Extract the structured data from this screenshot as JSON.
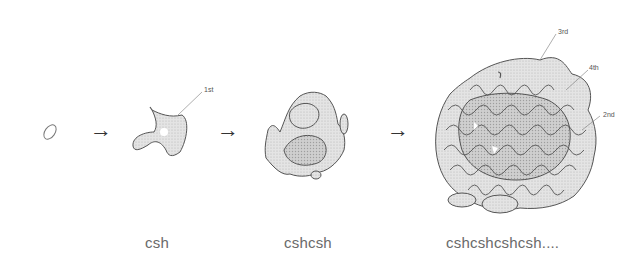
{
  "diagram": {
    "stages": [
      {
        "id": "seed",
        "label": ""
      },
      {
        "id": "stage1",
        "label": "csh"
      },
      {
        "id": "stage2",
        "label": "cshcsh"
      },
      {
        "id": "stage3",
        "label": "cshcshcshcsh...."
      }
    ],
    "arrows": [
      "→",
      "→",
      "→"
    ],
    "callouts": [
      {
        "label": "1st"
      },
      {
        "label": "3rd"
      },
      {
        "label": "4th"
      },
      {
        "label": "2nd"
      }
    ],
    "colors": {
      "outline": "#555555",
      "fill": "#d6d6d6",
      "text": "#6a6a6a"
    }
  }
}
